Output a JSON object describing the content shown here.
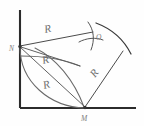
{
  "figure": {
    "background_color": "#fefefe",
    "stroke_color": "#3a3a3a",
    "label_color": "#7c7c7c",
    "points": {
      "vertex": {
        "name": "vertex-corner",
        "x": 20,
        "y": 108
      },
      "N": {
        "label": "N",
        "x": 20,
        "y": 46,
        "label_x": 9,
        "label_y": 51
      },
      "M": {
        "label": "M",
        "x": 85,
        "y": 108,
        "label_x": 82,
        "label_y": 121
      },
      "O": {
        "label": "O",
        "x": 92,
        "y": 39,
        "label_x": 96,
        "label_y": 38
      }
    },
    "radius_labels": [
      {
        "label": "R",
        "x": 45,
        "y": 32,
        "rotate": -12
      },
      {
        "label": "R",
        "x": 45,
        "y": 63,
        "rotate": -14
      },
      {
        "label": "R",
        "x": 46,
        "y": 88,
        "rotate": -16
      },
      {
        "label": "R",
        "x": 96,
        "y": 76,
        "rotate": -52
      }
    ],
    "axes": {
      "vertical": {
        "x1": 20,
        "y1": 10,
        "x2": 20,
        "y2": 108
      },
      "horizontal": {
        "x1": 20,
        "y1": 108,
        "x2": 136,
        "y2": 108
      }
    },
    "segments": [
      {
        "name": "segment-N-to-O",
        "x1": 20,
        "y1": 46,
        "x2": 92,
        "y2": 32
      },
      {
        "name": "segment-N-to-arcmid",
        "x1": 20,
        "y1": 46,
        "x2": 78,
        "y2": 62
      },
      {
        "name": "segment-N-to-M",
        "x1": 20,
        "y1": 46,
        "x2": 85,
        "y2": 108
      },
      {
        "name": "segment-vertex-to-N",
        "x1": 20,
        "y1": 108,
        "x2": 20,
        "y2": 46
      },
      {
        "name": "segment-M-to-outer",
        "x1": 85,
        "y1": 108,
        "x2": 123,
        "y2": 52
      }
    ],
    "arcs": [
      {
        "name": "arc-quarter-from-N-to-M",
        "d": "M 20 46 A 62 62 0 0 1 85 108"
      },
      {
        "name": "arc-inner-from-N",
        "d": "M 20 55 A 60 60 0 0 1 81 65"
      },
      {
        "name": "arc-outer-major",
        "d": "M 93 22 A 72 72 0 0 1 129 46"
      },
      {
        "name": "arc-cross-a",
        "d": "M 88 24 A 30 30 0 0 1 96 52"
      },
      {
        "name": "arc-cross-b",
        "d": "M 73 40 A 34 34 0 0 0 110 38"
      }
    ]
  }
}
